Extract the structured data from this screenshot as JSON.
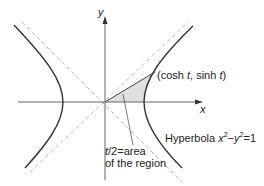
{
  "diagram": {
    "axes": {
      "x_label": "x",
      "y_label": "y"
    },
    "point_label": {
      "prefix": "(cosh ",
      "t1": "t",
      "mid": ", sinh ",
      "t2": "t",
      "suffix": ")"
    },
    "curve_label": {
      "text": "Hyperbola ",
      "eq_x": "x",
      "sup1": "2",
      "minus": "−",
      "eq_y": "y",
      "sup2": "2",
      "rhs": "=1"
    },
    "area_label": {
      "line1_t": "t",
      "line1_rest": "/2=area",
      "line2": "of the region"
    },
    "colors": {
      "curve": "#333333",
      "asymptote": "#bbbbbb",
      "region_fill": "#e0e0e0",
      "axis": "#666666"
    }
  }
}
